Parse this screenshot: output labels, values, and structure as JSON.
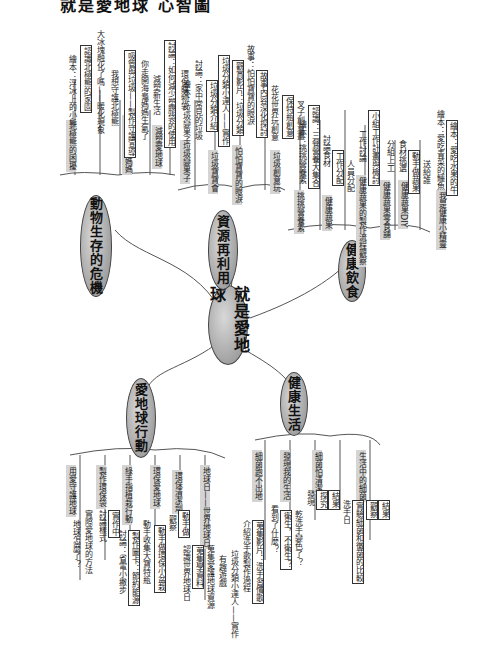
{
  "title": "就是愛地球 心智圖",
  "center": {
    "label": "就是愛地球"
  },
  "branches": [
    {
      "label": "動物生存的危機",
      "children": [
        {
          "label": "北極熊的困擾",
          "items": [
            "繪本：浮冰上的小熊",
            "認識北極熊的家園",
            "大冰塊融化了嗎——暖化現象",
            "我想守護北極熊"
          ]
        },
        {
          "label": "悲傷的海龜媽媽",
          "items": [
            "吸管與垃圾——製作守護宣導",
            "你走開海龜媽媽生氣了"
          ]
        },
        {
          "label": "減塑愛地球",
          "items": [
            "減塑新生活",
            "討論：如何減少塑膠袋的使用",
            "環保購物袋",
            "減塑小尖兵"
          ]
        }
      ]
    },
    {
      "label": "資源再利用",
      "children": [
        {
          "label": "垃圾變果子",
          "items": [
            "繪本：垃圾變果子",
            "討論：家中常見的垃圾"
          ]
        },
        {
          "label": "垃圾寶寶會",
          "items": [
            "垃圾分類介紹",
            "垃圾分類小達人——實作"
          ]
        },
        {
          "label": "怕怕寶寶的眼淚",
          "items": [
            "觀賞影片：垃圾分類",
            "故事：怕怕寶寶的眼淚",
            "故事內容深化探討"
          ]
        },
        {
          "label": "垃圾創意玩",
          "items": [
            "創意活動：廢棄紙箱",
            "花花世界玩創意",
            "保特瓶創意",
            "叉子創意畫"
          ]
        }
      ]
    },
    {
      "label": "健康飲食",
      "children": [
        {
          "label": "挑挑營養素",
          "items": [
            "繪本：挑挑營養素",
            "認識：三餐營養大集合"
          ]
        },
        {
          "label": "健康蔬果",
          "items": [
            "討論食材",
            "工作分配",
            "人員分配"
          ]
        },
        {
          "label": "健康蔬果的製作流程觀察",
          "items": [
            "工作討論",
            "小組工作計畫與檢討"
          ]
        },
        {
          "label": "健康蔬果零食舖",
          "items": [
            "分組上工"
          ]
        },
        {
          "label": "健康蔬果DIY",
          "items": [
            "食材挑選",
            "動手做蔬果",
            "送給誰"
          ]
        },
        {
          "label": "我是健康小精靈",
          "items": [
            "繪本：愛吃青菜的鱷魚",
            "繪本：愛吃水果的牛"
          ]
        }
      ]
    },
    {
      "label": "愛地球行動",
      "children": [
        {
          "label": "用愛守護地球",
          "items": [
            "地球怎麼了？",
            "實際愛地球的方法"
          ]
        },
        {
          "label": "製作環保袋",
          "items": [
            "討論樣式",
            "實作中"
          ]
        },
        {
          "label": "綠手指植栽行動",
          "items": [
            "討論：省電小撇步",
            "製作圖卡：節約能源",
            "動手收集大寶特瓶",
            "水資源寶寶小種子"
          ]
        },
        {
          "label": "環保愛地球",
          "items": [
            "動手做環保小盆栽"
          ]
        },
        {
          "label": "環保清潔劑",
          "items": [
            "觀察",
            "動手做"
          ]
        },
        {
          "label": "地球日——世界地球日",
          "items": [
            "認識世界地球日",
            "蒐集學資料",
            "蒐集愛護地球資源",
            "有趣遊戲",
            "垃圾分類小達人——實作"
          ]
        },
        {
          "label": "世界地球日活動"
        }
      ]
    },
    {
      "label": "健康生活",
      "children": [
        {
          "label": "細菌跑不出地",
          "items": [
            "介紹洗手歌製作過程",
            "蒐集影片：洗手習慣歌",
            "發現洗手的重要性"
          ]
        },
        {
          "label": "發現我的生活",
          "items": [
            "看到了什麼？",
            "衛生，不衛生？",
            "乾洗手變色了？"
          ]
        },
        {
          "label": "細菌怕清潔",
          "items": [
            "發現",
            "探究",
            "結果"
          ]
        },
        {
          "label": "好習慣",
          "items": [
            "洗手日"
          ]
        },
        {
          "label": "生活中的細菌",
          "items": [
            "實驗細菌和黴菌的比較",
            "觀察",
            "結果"
          ]
        }
      ]
    }
  ]
}
